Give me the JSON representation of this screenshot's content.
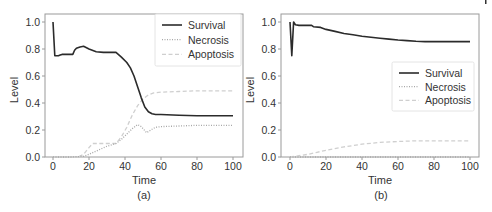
{
  "chart_data": [
    {
      "type": "line",
      "panel_label": "(a)",
      "title": "",
      "xlabel": "Time",
      "ylabel": "Level",
      "xlim": [
        -3,
        105
      ],
      "ylim": [
        0,
        1.05
      ],
      "xticks": [
        0,
        20,
        40,
        60,
        80,
        100
      ],
      "yticks": [
        0.0,
        0.2,
        0.4,
        0.6,
        0.8,
        1.0
      ],
      "ytick_labels": [
        "0.0",
        "0.2",
        "0.4",
        "0.6",
        "0.8",
        "1.0"
      ],
      "grid": false,
      "legend_position": "upper right",
      "series": [
        {
          "name": "Survival",
          "style": "solid",
          "color": "#2b2b2b",
          "x": [
            0,
            1,
            3,
            4,
            5,
            8,
            11,
            12,
            13,
            15,
            17,
            20,
            24,
            28,
            32,
            35,
            38,
            41,
            43,
            45,
            47,
            49,
            51,
            53,
            55,
            57,
            60,
            70,
            80,
            90,
            100
          ],
          "values": [
            1.0,
            0.75,
            0.75,
            0.755,
            0.76,
            0.76,
            0.76,
            0.79,
            0.805,
            0.815,
            0.82,
            0.8,
            0.78,
            0.775,
            0.775,
            0.775,
            0.74,
            0.7,
            0.66,
            0.6,
            0.52,
            0.44,
            0.37,
            0.335,
            0.32,
            0.315,
            0.315,
            0.31,
            0.305,
            0.305,
            0.305
          ]
        },
        {
          "name": "Necrosis",
          "style": "dotted",
          "color": "#a8a8a8",
          "x": [
            0,
            10,
            17,
            20,
            25,
            30,
            35,
            38,
            41,
            44,
            47,
            49,
            52,
            55,
            57,
            60,
            70,
            80,
            100
          ],
          "values": [
            0,
            0,
            0.005,
            0.02,
            0.05,
            0.08,
            0.1,
            0.13,
            0.17,
            0.21,
            0.24,
            0.225,
            0.18,
            0.205,
            0.22,
            0.225,
            0.23,
            0.235,
            0.235
          ]
        },
        {
          "name": "Apoptosis",
          "style": "dashed",
          "color": "#cfcfcf",
          "x": [
            0,
            14,
            17,
            20,
            22,
            25,
            30,
            35,
            38,
            41,
            44,
            47,
            50,
            53,
            56,
            60,
            70,
            80,
            100
          ],
          "values": [
            0,
            0,
            0.02,
            0.07,
            0.1,
            0.1,
            0.1,
            0.1,
            0.15,
            0.22,
            0.31,
            0.38,
            0.43,
            0.46,
            0.475,
            0.48,
            0.485,
            0.49,
            0.49
          ]
        }
      ],
      "legend": [
        "Survival",
        "Necrosis",
        "Apoptosis"
      ]
    },
    {
      "type": "line",
      "panel_label": "(b)",
      "title": "",
      "xlabel": "Time",
      "ylabel": "Level",
      "xlim": [
        -3,
        105
      ],
      "ylim": [
        0,
        1.05
      ],
      "xticks": [
        0,
        20,
        40,
        60,
        80,
        100
      ],
      "yticks": [
        0.0,
        0.2,
        0.4,
        0.6,
        0.8,
        1.0
      ],
      "ytick_labels": [
        "0.0",
        "0.2",
        "0.4",
        "0.6",
        "0.8",
        "1.0"
      ],
      "grid": false,
      "legend_position": "center right",
      "series": [
        {
          "name": "Survival",
          "style": "solid",
          "color": "#2b2b2b",
          "x": [
            0,
            1,
            2,
            3,
            5,
            12,
            13,
            17,
            20,
            25,
            30,
            35,
            40,
            45,
            50,
            55,
            60,
            65,
            70,
            75,
            80,
            90,
            100
          ],
          "values": [
            1.0,
            0.75,
            1.0,
            0.98,
            0.975,
            0.975,
            0.965,
            0.96,
            0.945,
            0.93,
            0.915,
            0.905,
            0.895,
            0.887,
            0.88,
            0.873,
            0.867,
            0.862,
            0.858,
            0.855,
            0.855,
            0.855,
            0.855
          ]
        },
        {
          "name": "Necrosis",
          "style": "dotted",
          "color": "#a8a8a8",
          "x": [
            0,
            100
          ],
          "values": [
            0,
            0
          ]
        },
        {
          "name": "Apoptosis",
          "style": "dashed",
          "color": "#cfcfcf",
          "x": [
            0,
            5,
            10,
            15,
            20,
            30,
            40,
            50,
            60,
            70,
            80,
            90,
            100
          ],
          "values": [
            0,
            0.01,
            0.02,
            0.035,
            0.05,
            0.075,
            0.095,
            0.108,
            0.115,
            0.12,
            0.12,
            0.12,
            0.12
          ]
        }
      ],
      "legend": [
        "Survival",
        "Necrosis",
        "Apoptosis"
      ]
    }
  ]
}
